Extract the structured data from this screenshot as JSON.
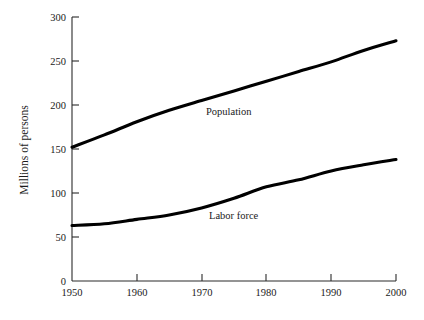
{
  "chart_data": {
    "type": "line",
    "title": "",
    "xlabel": "",
    "ylabel": "Millions of persons",
    "xlim": [
      1950,
      2000
    ],
    "ylim": [
      0,
      300
    ],
    "grid": false,
    "legend_position": "inline-labels",
    "x_ticks": [
      "1950",
      "1960",
      "1970",
      "1980",
      "1990",
      "2000"
    ],
    "y_ticks": [
      "0",
      "50",
      "100",
      "150",
      "200",
      "250",
      "300"
    ],
    "x": [
      1950,
      1955,
      1960,
      1965,
      1970,
      1975,
      1980,
      1985,
      1990,
      1995,
      2000
    ],
    "series": [
      {
        "name": "Population",
        "label": "Population",
        "color": "#000000",
        "values": [
          152,
          166,
          181,
          194,
          205,
          216,
          227,
          238,
          249,
          262,
          273
        ]
      },
      {
        "name": "Labor force",
        "label": "Labor force",
        "color": "#000000",
        "values": [
          63,
          65,
          70,
          75,
          83,
          94,
          107,
          115,
          125,
          132,
          138
        ]
      }
    ]
  },
  "axes": {
    "y_title": "Millions of persons"
  },
  "labels": {
    "population": "Population",
    "labor_force": "Labor force"
  }
}
